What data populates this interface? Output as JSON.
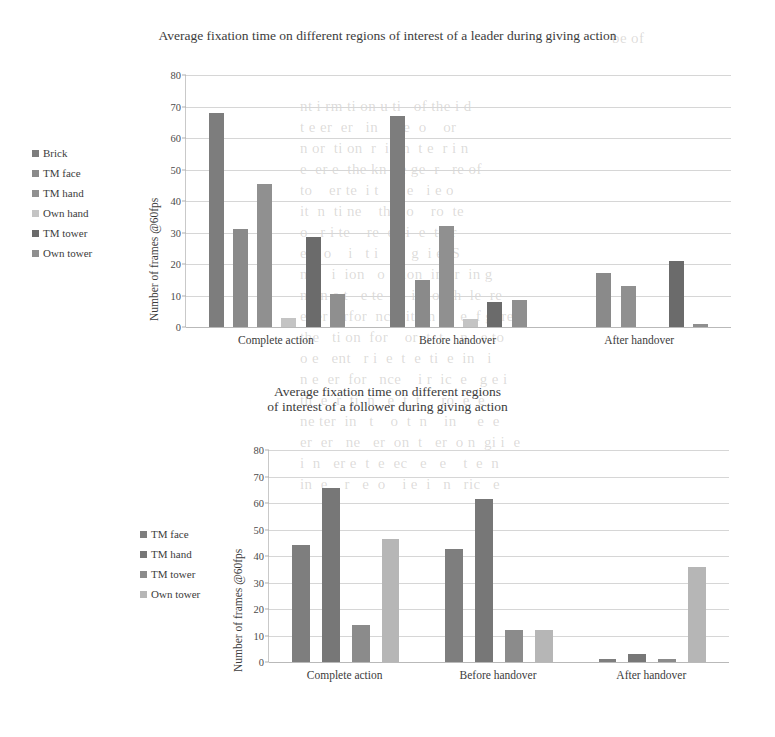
{
  "page": {
    "bleed_lines": [
      {
        "x": 612,
        "y": 28,
        "text": "be of"
      },
      {
        "x": 300,
        "y": 96,
        "text": "nt i rm ti on u ti   of the i d"
      },
      {
        "x": 300,
        "y": 117,
        "text": "t e er  er   in    t e  o    or"
      },
      {
        "x": 300,
        "y": 138,
        "text": "n or  ti on  r  i  in  t e  r i n"
      },
      {
        "x": 300,
        "y": 159,
        "text": "e  er e  the kn  le ge  r   re of"
      },
      {
        "x": 300,
        "y": 180,
        "text": "to    er te  i t    c e   i e o"
      },
      {
        "x": 300,
        "y": 201,
        "text": "it  n  ti ne    the  o    ro  te"
      },
      {
        "x": 300,
        "y": 222,
        "text": "o   r i te    re  e ci  e  t  tr"
      },
      {
        "x": 300,
        "y": 243,
        "text": "e    o    i   t i   h   g  i e  S "
      },
      {
        "x": 300,
        "y": 264,
        "text": "ne    i  ion   o  i ion  in er  in g"
      },
      {
        "x": 300,
        "y": 285,
        "text": "n   n e t   e te   e  in  of  h  le  re"
      },
      {
        "x": 300,
        "y": 306,
        "text": "e  er  erfor  nce  it  in  o  e  f g  re"
      },
      {
        "x": 300,
        "y": 327,
        "text": "the   ti on  for    or  t  t    n   e to"
      },
      {
        "x": 300,
        "y": 348,
        "text": "o e   ent   r i  e  t  e  ti  e  in   i"
      },
      {
        "x": 300,
        "y": 369,
        "text": "n e  er  for   nce    i r  ic  e   g e i"
      },
      {
        "x": 300,
        "y": 390,
        "text": "th  e  r  ti  n   e  t  t     ro  e  e"
      },
      {
        "x": 300,
        "y": 411,
        "text": "ne ter  in   t    o  t  n    in     e  e"
      },
      {
        "x": 300,
        "y": 432,
        "text": "er  er   ne   er  on  t   er  o n  gi i  e"
      },
      {
        "x": 300,
        "y": 453,
        "text": "i  n   er e  t  e  ec   e   e    t  e  n"
      },
      {
        "x": 300,
        "y": 474,
        "text": "in  e    r   e  o    i e  i   n   ric   e"
      }
    ]
  },
  "charts": [
    {
      "title": "Average fixation time on different regions of interest of a leader during giving action",
      "legend_title": "",
      "ylabel": "Number of frames @60fps",
      "categories": [
        "Complete action",
        "Before handover",
        "After handover"
      ],
      "series": [
        {
          "name": "Brick",
          "color": "#7d7d7d",
          "values": [
            68,
            67,
            0
          ]
        },
        {
          "name": "TM face",
          "color": "#8a8a8a",
          "values": [
            31,
            15,
            17
          ]
        },
        {
          "name": "TM hand",
          "color": "#909090",
          "values": [
            45.5,
            32,
            13
          ]
        },
        {
          "name": "Own hand",
          "color": "#c4c4c4",
          "values": [
            3,
            2.5,
            0
          ]
        },
        {
          "name": "TM tower",
          "color": "#6b6b6b",
          "values": [
            28.5,
            8,
            21
          ]
        },
        {
          "name": "Own tower",
          "color": "#8f8f8f",
          "values": [
            10.5,
            8.5,
            1
          ]
        }
      ],
      "yticks": [
        0,
        10,
        20,
        30,
        40,
        50,
        60,
        70,
        80
      ],
      "ylim": [
        0,
        80
      ]
    },
    {
      "title_line1": "Average fixation time on different regions",
      "title_line2": "of interest of a follower during giving action",
      "ylabel": "Number of frames @60fps",
      "categories": [
        "Complete action",
        "Before handover",
        "After handover"
      ],
      "series": [
        {
          "name": "TM face",
          "color": "#7e7e7e",
          "values": [
            44,
            42.5,
            1
          ]
        },
        {
          "name": "TM hand",
          "color": "#777777",
          "values": [
            65.5,
            61.5,
            3
          ]
        },
        {
          "name": "TM tower",
          "color": "#8b8b8b",
          "values": [
            14,
            12,
            1
          ]
        },
        {
          "name": "Own tower",
          "color": "#b6b6b6",
          "values": [
            46.5,
            12,
            36
          ]
        }
      ],
      "yticks": [
        0,
        10,
        20,
        30,
        40,
        50,
        60,
        70,
        80
      ],
      "ylim": [
        0,
        80
      ]
    }
  ],
  "chart_data": [
    {
      "type": "bar",
      "title": "Average fixation time on different regions of interest of a leader during giving action",
      "xlabel": "",
      "ylabel": "Number of frames @60fps",
      "categories": [
        "Complete action",
        "Before handover",
        "After handover"
      ],
      "series": [
        {
          "name": "Brick",
          "values": [
            68,
            67,
            0
          ]
        },
        {
          "name": "TM face",
          "values": [
            31,
            15,
            17
          ]
        },
        {
          "name": "TM hand",
          "values": [
            45.5,
            32,
            13
          ]
        },
        {
          "name": "Own hand",
          "values": [
            3,
            2.5,
            0
          ]
        },
        {
          "name": "TM tower",
          "values": [
            28.5,
            8,
            21
          ]
        },
        {
          "name": "Own tower",
          "values": [
            10.5,
            8.5,
            1
          ]
        }
      ],
      "ylim": [
        0,
        80
      ],
      "yticks": [
        0,
        10,
        20,
        30,
        40,
        50,
        60,
        70,
        80
      ],
      "grid": "horizontal",
      "legend_position": "left"
    },
    {
      "type": "bar",
      "title": "Average fixation time on different regions of interest of a follower during giving action",
      "xlabel": "",
      "ylabel": "Number of frames @60fps",
      "categories": [
        "Complete action",
        "Before handover",
        "After handover"
      ],
      "series": [
        {
          "name": "TM face",
          "values": [
            44,
            42.5,
            1
          ]
        },
        {
          "name": "TM hand",
          "values": [
            65.5,
            61.5,
            3
          ]
        },
        {
          "name": "TM tower",
          "values": [
            14,
            12,
            1
          ]
        },
        {
          "name": "Own tower",
          "values": [
            46.5,
            12,
            36
          ]
        }
      ],
      "ylim": [
        0,
        80
      ],
      "yticks": [
        0,
        10,
        20,
        30,
        40,
        50,
        60,
        70,
        80
      ],
      "grid": "horizontal",
      "legend_position": "left"
    }
  ]
}
